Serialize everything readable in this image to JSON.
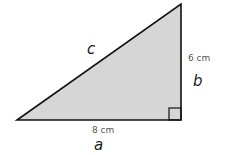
{
  "diagram": {
    "type": "right-triangle",
    "fill_color": "#d6d6d6",
    "stroke_color": "#111111",
    "vertices": [
      [
        17,
        120
      ],
      [
        181,
        120
      ],
      [
        181,
        4
      ]
    ],
    "sides": {
      "a": {
        "name": "a",
        "length_label": "8 cm"
      },
      "b": {
        "name": "b",
        "length_label": "6 cm"
      },
      "c": {
        "name": "c",
        "length_label": ""
      }
    },
    "right_angle_marker": true
  }
}
